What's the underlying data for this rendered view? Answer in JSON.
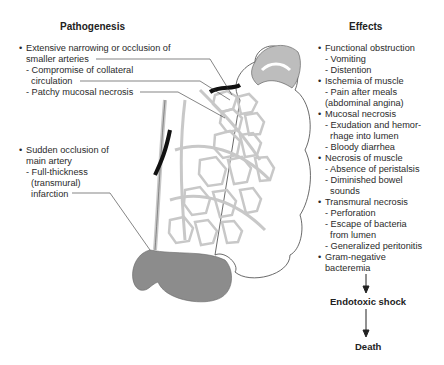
{
  "pathogenesis": {
    "title": "Pathogenesis",
    "items": [
      {
        "bullet": "Extensive narrowing or occlusion of",
        "bullet2": "smaller arteries",
        "subs": [
          "- Compromise of collateral",
          "  circulation",
          "- Patchy mucosal necrosis"
        ]
      },
      {
        "bullet": "Sudden occlusion of",
        "bullet2": "main artery",
        "subs": [
          "- Full-thickness",
          "  (transmural)",
          "  infarction"
        ]
      }
    ]
  },
  "effects": {
    "title": "Effects",
    "lines": [
      {
        "t": "Functional obstruction",
        "b": true
      },
      {
        "t": "- Vomiting"
      },
      {
        "t": "- Distention"
      },
      {
        "t": "Ischemia of muscle",
        "b": true
      },
      {
        "t": "- Pain after meals"
      },
      {
        "t": "(abdominal angina)"
      },
      {
        "t": "Mucosal necrosis",
        "b": true
      },
      {
        "t": "- Exudation and hemor-"
      },
      {
        "t": "  rhage into lumen"
      },
      {
        "t": "- Bloody diarrhea"
      },
      {
        "t": "Necrosis of muscle",
        "b": true
      },
      {
        "t": "- Absence of peristalsis"
      },
      {
        "t": "- Diminished bowel"
      },
      {
        "t": "  sounds"
      },
      {
        "t": "Transmural necrosis",
        "b": true
      },
      {
        "t": "- Perforation"
      },
      {
        "t": "- Escape of bacteria"
      },
      {
        "t": "  from lumen"
      },
      {
        "t": "- Generalized peritonitis"
      },
      {
        "t": "Gram-negative",
        "b": true
      },
      {
        "t": "bacteremia"
      }
    ]
  },
  "flow": {
    "step1": "Endotoxic shock",
    "step2": "Death"
  },
  "colors": {
    "vessel_fill": "#c8c8c8",
    "infarct_gray": "#8c8c8c",
    "patchy_gray": "#bdbdbd",
    "occlusion": "#111111"
  }
}
